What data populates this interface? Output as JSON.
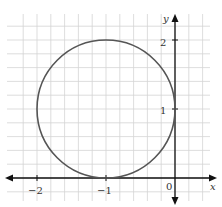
{
  "chart_data": {
    "type": "line",
    "title": "",
    "xlabel": "x",
    "ylabel": "y",
    "xlim": [
      -2.4,
      0.5
    ],
    "ylim": [
      -0.3,
      2.45
    ],
    "grid": true,
    "grid_step": 0.2,
    "x_ticks": [
      {
        "value": -2,
        "label": "−2"
      },
      {
        "value": -1,
        "label": "−1"
      }
    ],
    "y_ticks": [
      {
        "value": 1,
        "label": "1"
      },
      {
        "value": 2,
        "label": "2"
      }
    ],
    "origin_label": "0",
    "series": [
      {
        "name": "circle",
        "shape": "circle",
        "center": [
          -1,
          1
        ],
        "radius": 1,
        "color": "#555555"
      }
    ]
  }
}
